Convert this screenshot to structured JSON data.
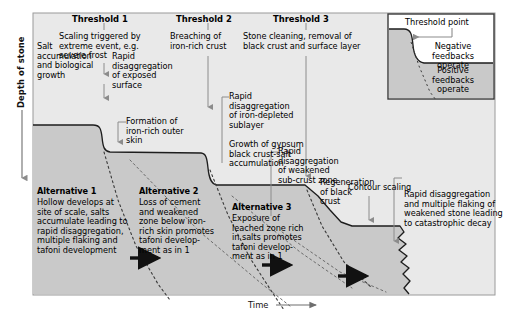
{
  "figure": {
    "axis_y_label": "Depth of stone",
    "axis_x_label": "Time"
  },
  "thresholds": [
    {
      "title": "Threshold 1",
      "description": "Scaling triggered by\nextreme event, e.g.\nsevere frost"
    },
    {
      "title": "Threshold 2",
      "description": "Breaching of\niron-rich crust"
    },
    {
      "title": "Threshold 3",
      "description": "Stone cleaning, removal of\nblack crust and surface layer"
    }
  ],
  "process_labels": [
    {
      "name": "salt-accumulation",
      "text": "Salt\naccumulation\nand biological\ngrowth"
    },
    {
      "name": "rapid-disaggregation-exposed",
      "text": "Rapid\ndisaggregation\nof exposed\nsurface"
    },
    {
      "name": "formation-iron-skin",
      "text": "Formation of\niron-rich outer\nskin"
    },
    {
      "name": "rapid-disaggregation-sublayer",
      "text": "Rapid\ndisaggregation\nof iron-depleted\nsublayer"
    },
    {
      "name": "gypsum-growth",
      "text": "Growth of gypsum\nblack crust-salt\naccumulation"
    },
    {
      "name": "rapid-disaggregation-subcrust",
      "text": "Rapid\ndisaggregation\nof weakened\nsub-crust zone"
    },
    {
      "name": "regeneration-black-crust",
      "text": "Regeneration\nof black\ncrust"
    },
    {
      "name": "contour-scaling",
      "text": "Contour scaling"
    },
    {
      "name": "catastrophic-decay",
      "text": "Rapid disaggregation\nand multiple flaking of\nweakened stone leading\nto catastrophic decay"
    }
  ],
  "alternatives": [
    {
      "title": "Alternative 1",
      "text": "Hollow develops at\nsite of scale, salts\naccumulate leading to\nrapid disaggregation,\nmultiple flaking and\ntafoni development"
    },
    {
      "title": "Alternative 2",
      "text": "Loss of cement\nand weakened\nzone below iron-\nrich skin promotes\ntafoni develop-\nment as in 1"
    },
    {
      "title": "Alternative 3",
      "text": "Exposure of\nleached zone rich\nin salts promotes\ntafoni develop-\nment as in 1"
    }
  ],
  "inset": {
    "threshold_point": "Threshold point",
    "negative": "Negative feedbacks\noperate",
    "positive": "Positive\nfeedbacks\noperate"
  },
  "colors": {
    "stone_fill": "#c9c9c9",
    "air_fill": "#e9e9e9",
    "border": "#9a9a9a",
    "curve": "#1a1a1a",
    "arrow_gray": "#8c8c8c",
    "text": "#000000"
  }
}
